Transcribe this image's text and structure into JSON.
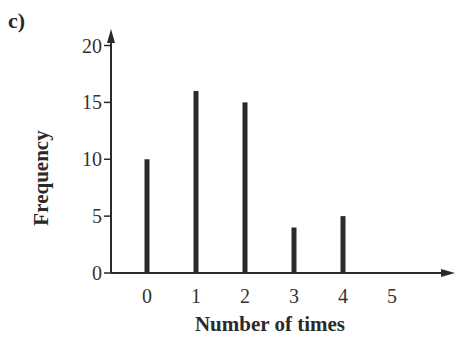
{
  "part_label": "c)",
  "chart_data": {
    "type": "bar",
    "title": "",
    "xlabel": "Number of times",
    "ylabel": "Frequency",
    "categories": [
      "0",
      "1",
      "2",
      "3",
      "4",
      "5"
    ],
    "values": [
      10,
      16,
      15,
      4,
      5,
      0
    ],
    "ylim": [
      0,
      20
    ],
    "yticks": [
      0,
      5,
      10,
      15,
      20
    ],
    "grid": false,
    "legend": null,
    "bar_color": "#2a2a2a"
  }
}
